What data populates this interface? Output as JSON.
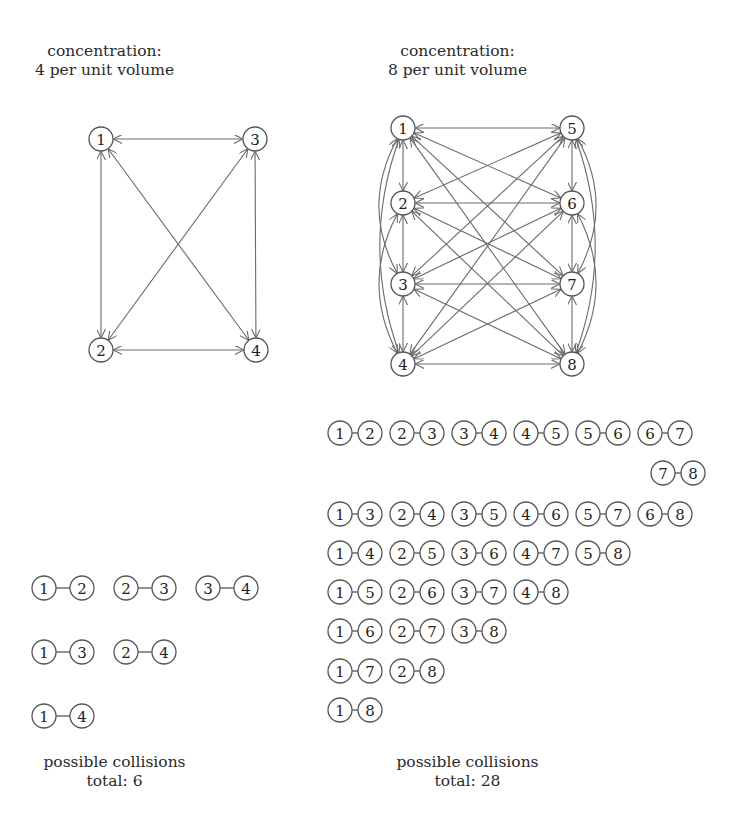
{
  "left": {
    "title_line1": "concentration:",
    "title_line2": "4 per unit volume",
    "nodes": [
      {
        "id": "1",
        "x": 101,
        "y": 139
      },
      {
        "id": "3",
        "x": 255,
        "y": 139
      },
      {
        "id": "2",
        "x": 101,
        "y": 350
      },
      {
        "id": "4",
        "x": 256,
        "y": 350
      }
    ],
    "edges": [
      [
        "1",
        "3"
      ],
      [
        "1",
        "2"
      ],
      [
        "1",
        "4"
      ],
      [
        "3",
        "2"
      ],
      [
        "3",
        "4"
      ],
      [
        "2",
        "4"
      ]
    ],
    "pairs": [
      {
        "row": 0,
        "items": [
          [
            "1",
            "2"
          ],
          [
            "2",
            "3"
          ],
          [
            "3",
            "4"
          ]
        ]
      },
      {
        "row": 1,
        "items": [
          [
            "1",
            "3"
          ],
          [
            "2",
            "4"
          ]
        ]
      },
      {
        "row": 2,
        "items": [
          [
            "1",
            "4"
          ]
        ]
      }
    ],
    "footer_line1": "possible collisions",
    "footer_line2": "total: 6"
  },
  "right": {
    "title_line1": "concentration:",
    "title_line2": "8 per unit volume",
    "nodes": [
      {
        "id": "1",
        "x": 403,
        "y": 128
      },
      {
        "id": "5",
        "x": 572,
        "y": 128
      },
      {
        "id": "2",
        "x": 403,
        "y": 203
      },
      {
        "id": "6",
        "x": 572,
        "y": 203
      },
      {
        "id": "3",
        "x": 403,
        "y": 284
      },
      {
        "id": "7",
        "x": 572,
        "y": 284
      },
      {
        "id": "4",
        "x": 403,
        "y": 364
      },
      {
        "id": "8",
        "x": 572,
        "y": 364
      }
    ],
    "pairs": [
      {
        "row": 0,
        "items": [
          [
            "1",
            "2"
          ],
          [
            "2",
            "3"
          ],
          [
            "3",
            "4"
          ],
          [
            "4",
            "5"
          ],
          [
            "5",
            "6"
          ],
          [
            "6",
            "7"
          ]
        ]
      },
      {
        "row": 1,
        "items": [
          [
            "7",
            "8"
          ]
        ]
      },
      {
        "row": 2,
        "items": [
          [
            "1",
            "3"
          ],
          [
            "2",
            "4"
          ],
          [
            "3",
            "5"
          ],
          [
            "4",
            "6"
          ],
          [
            "5",
            "7"
          ],
          [
            "6",
            "8"
          ]
        ]
      },
      {
        "row": 3,
        "items": [
          [
            "1",
            "4"
          ],
          [
            "2",
            "5"
          ],
          [
            "3",
            "6"
          ],
          [
            "4",
            "7"
          ],
          [
            "5",
            "8"
          ]
        ]
      },
      {
        "row": 4,
        "items": [
          [
            "1",
            "5"
          ],
          [
            "2",
            "6"
          ],
          [
            "3",
            "7"
          ],
          [
            "4",
            "8"
          ]
        ]
      },
      {
        "row": 5,
        "items": [
          [
            "1",
            "6"
          ],
          [
            "2",
            "7"
          ],
          [
            "3",
            "8"
          ]
        ]
      },
      {
        "row": 6,
        "items": [
          [
            "1",
            "7"
          ],
          [
            "2",
            "8"
          ]
        ]
      },
      {
        "row": 7,
        "items": [
          [
            "1",
            "8"
          ]
        ]
      }
    ],
    "footer_line1": "possible collisions",
    "footer_line2": "total: 28"
  },
  "colors": {
    "stroke": "#555555",
    "edge": "#6a6a6a",
    "text": "#222222",
    "background": "#ffffff"
  }
}
